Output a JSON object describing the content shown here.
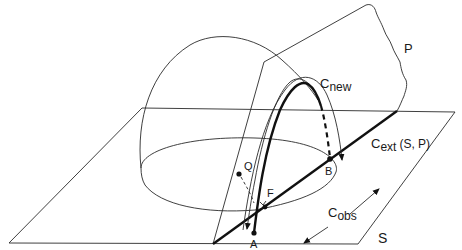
{
  "figure": {
    "labels": {
      "plane_p": "P",
      "plane_s": "S",
      "c_new_main": "C",
      "c_new_sub": "new",
      "c_ext_main": "C",
      "c_ext_sub": "ext",
      "c_ext_args": "(S, P)",
      "c_obs_main": "C",
      "c_obs_sub": "obs",
      "point_a": "A",
      "point_b": "B",
      "point_q": "Q",
      "point_f": "F"
    },
    "colors": {
      "line": "#1a1a1a",
      "background": "#ffffff"
    }
  }
}
